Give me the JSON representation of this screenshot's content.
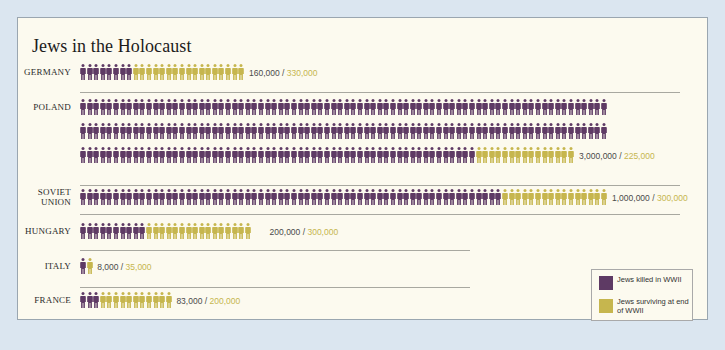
{
  "title": "Jews in the Holocaust",
  "colors": {
    "killed": "#5e3a64",
    "surviving": "#c6b64e",
    "background": "#dbe6f0",
    "card": "#fcfaef"
  },
  "legend": {
    "killed_label": "Jews killed in WWII",
    "surviving_label": "Jews surviving at end of WWII"
  },
  "countries": [
    {
      "name": "GERMANY",
      "killed": "160,000",
      "surviving": "330,000"
    },
    {
      "name": "POLAND",
      "killed": "3,000,000",
      "surviving": "225,000"
    },
    {
      "name": "SOVIET UNION",
      "killed": "1,000,000",
      "surviving": "300,000"
    },
    {
      "name": "HUNGARY",
      "killed": "200,000",
      "surviving": "300,000"
    },
    {
      "name": "ITALY",
      "killed": "8,000",
      "surviving": "35,000"
    },
    {
      "name": "FRANCE",
      "killed": "83,000",
      "surviving": "200,000"
    }
  ],
  "chart_data": {
    "type": "bar",
    "title": "Jews in the Holocaust",
    "subtype": "pictogram (stacked icon rows)",
    "categories": [
      "Germany",
      "Poland",
      "Soviet Union",
      "Hungary",
      "Italy",
      "France"
    ],
    "series": [
      {
        "name": "Jews killed in WWII",
        "color": "#5e3a64",
        "values": [
          160000,
          3000000,
          1000000,
          200000,
          8000,
          83000
        ]
      },
      {
        "name": "Jews surviving at end of WWII",
        "color": "#c6b64e",
        "values": [
          330000,
          225000,
          300000,
          300000,
          35000,
          200000
        ]
      }
    ],
    "icon_counts": {
      "killed": [
        8,
        220,
        64,
        10,
        1,
        3
      ],
      "surviving": [
        17,
        15,
        16,
        16,
        1,
        11
      ]
    },
    "legend_position": "bottom-right",
    "grid": false,
    "xlabel": "",
    "ylabel": ""
  }
}
